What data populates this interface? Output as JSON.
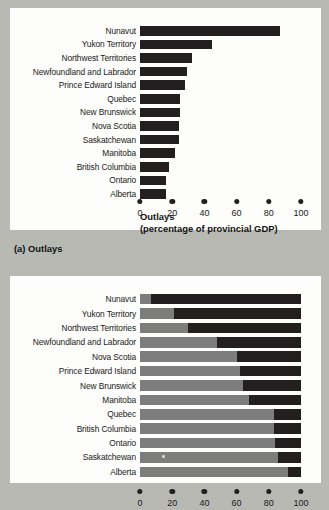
{
  "figure": {
    "panel_a_caption": "(a) Outlays",
    "axis_title_line1": "Outlays",
    "axis_title_line2": "(percentage of provincial GDP)"
  },
  "axis": {
    "ticks": [
      0,
      20,
      40,
      60,
      80,
      100
    ],
    "tick_labels": [
      "0",
      "20",
      "40",
      "60",
      "80",
      "100"
    ],
    "min": 0,
    "max": 100
  },
  "chart_data": [
    {
      "type": "bar",
      "orientation": "horizontal",
      "title": "(a) Outlays",
      "xlabel": "Outlays (percentage of provincial GDP)",
      "ylabel": "",
      "xlim": [
        0,
        100
      ],
      "grid": false,
      "legend": "none",
      "bar_color": "#231f20",
      "categories": [
        "Nunavut",
        "Yukon Territory",
        "Northwest Territories",
        "Newfoundland and Labrador",
        "Prince Edward Island",
        "Quebec",
        "New Brunswick",
        "Nova Scotia",
        "Saskatchewan",
        "Manitoba",
        "British Columbia",
        "Ontario",
        "Alberta"
      ],
      "values": [
        87,
        45,
        32,
        29,
        28,
        25,
        25,
        24,
        24,
        22,
        18,
        16,
        16
      ]
    },
    {
      "type": "bar",
      "orientation": "horizontal",
      "stacked": true,
      "title": "",
      "xlabel": "",
      "ylabel": "",
      "xlim": [
        0,
        100
      ],
      "grid": false,
      "legend": "none",
      "series": [
        {
          "name": "Own-source revenue",
          "color": "#7d7d7d",
          "values": [
            7,
            21,
            30,
            48,
            60,
            62,
            64,
            68,
            83,
            83,
            84,
            86,
            92
          ]
        },
        {
          "name": "Federal transfers",
          "color": "#231f20",
          "values": [
            93,
            79,
            70,
            52,
            40,
            38,
            36,
            32,
            17,
            17,
            16,
            14,
            8
          ]
        }
      ],
      "categories": [
        "Nunavut",
        "Yukon Territory",
        "Northwest Territories",
        "Newfoundland and Labrador",
        "Nova Scotia",
        "Prince Edward Island",
        "New Brunswick",
        "Manitoba",
        "Quebec",
        "British Columbia",
        "Ontario",
        "Saskatchewan",
        "Alberta"
      ]
    }
  ]
}
